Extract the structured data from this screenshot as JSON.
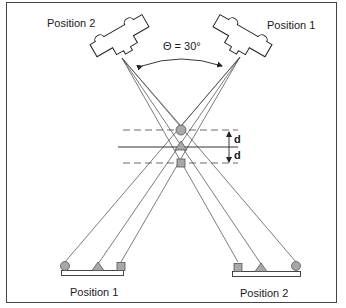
{
  "diagram": {
    "type": "stereo-camera-geometry",
    "cameras": [
      {
        "id": "left",
        "label": "Position 2"
      },
      {
        "id": "right",
        "label": "Position 1"
      }
    ],
    "angle_label": "Θ = 30°",
    "spacing_labels": [
      "d",
      "d"
    ],
    "markers": [
      {
        "shape": "circle",
        "role": "upper-plane"
      },
      {
        "shape": "triangle",
        "role": "reference-plane"
      },
      {
        "shape": "square",
        "role": "lower-plane"
      }
    ],
    "detectors": [
      {
        "id": "left-detector",
        "label": "Position 1",
        "order": [
          "circle",
          "triangle",
          "square"
        ]
      },
      {
        "id": "right-detector",
        "label": "Position 2",
        "order": [
          "square",
          "triangle",
          "circle"
        ]
      }
    ],
    "colors": {
      "line": "#333333",
      "marker_fill": "#a8a8a8",
      "marker_stroke": "#555555",
      "border": "#444444"
    }
  }
}
